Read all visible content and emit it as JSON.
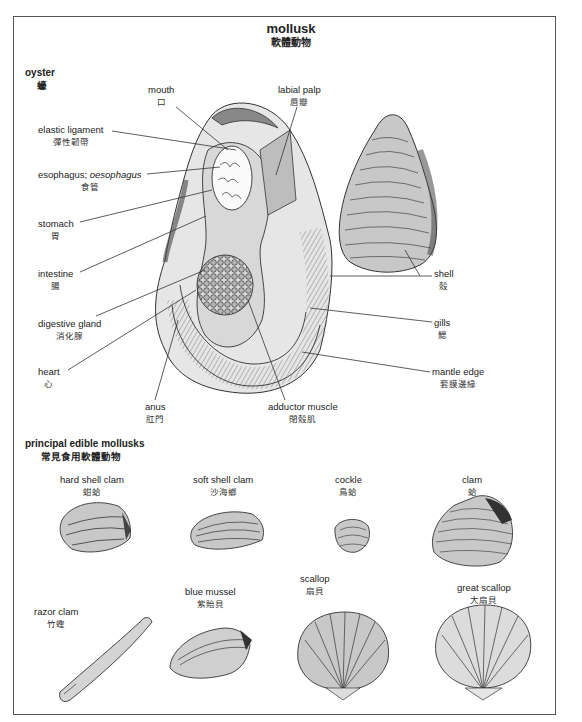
{
  "title": {
    "en": "mollusk",
    "zh": "軟體動物"
  },
  "oyster": {
    "heading": {
      "en": "oyster",
      "zh": "蠔"
    },
    "labels": {
      "mouth": {
        "en": "mouth",
        "zh": "口"
      },
      "labial_palp": {
        "en": "labial palp",
        "zh": "唇瓣"
      },
      "elastic_ligament": {
        "en": "elastic ligament",
        "zh": "彈性韌帶"
      },
      "esophagus": {
        "en": "esophagus;",
        "en_alt": "oesophagus",
        "zh": "食管"
      },
      "stomach": {
        "en": "stomach",
        "zh": "胃"
      },
      "intestine": {
        "en": "intestine",
        "zh": "腸"
      },
      "digestive_gland": {
        "en": "digestive gland",
        "zh": "消化腺"
      },
      "heart": {
        "en": "heart",
        "zh": "心"
      },
      "anus": {
        "en": "anus",
        "zh": "肛門"
      },
      "adductor_muscle": {
        "en": "adductor muscle",
        "zh": "閉殼肌"
      },
      "mantle_edge": {
        "en": "mantle edge",
        "zh": "套膜邊緣"
      },
      "gills": {
        "en": "gills",
        "zh": "鰓"
      },
      "shell": {
        "en": "shell",
        "zh": "殼"
      }
    }
  },
  "edible": {
    "heading": {
      "en": "principal edible mollusks",
      "zh": "常見食用軟體動物"
    },
    "items": [
      {
        "en": "hard shell clam",
        "zh": "蚶蛤"
      },
      {
        "en": "soft shell clam",
        "zh": "沙海螂"
      },
      {
        "en": "cockle",
        "zh": "鳥蛤"
      },
      {
        "en": "clam",
        "zh": "蛤"
      },
      {
        "en": "razor clam",
        "zh": "竹蟶"
      },
      {
        "en": "blue mussel",
        "zh": "紫貽貝"
      },
      {
        "en": "scallop",
        "zh": "扇貝"
      },
      {
        "en": "great scallop",
        "zh": "大扇貝"
      }
    ]
  },
  "colors": {
    "frame": "#555555",
    "shell_fill": "#c8c8c8",
    "shell_dark": "#555555",
    "line": "#333333"
  }
}
